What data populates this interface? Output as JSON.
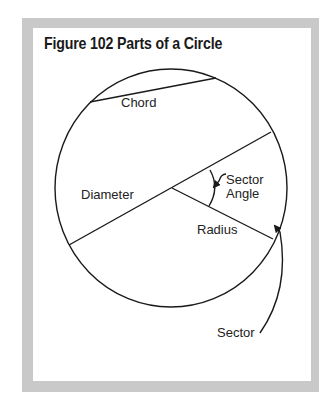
{
  "figure": {
    "title": "Figure 102  Parts of a Circle"
  },
  "labels": {
    "chord": "Chord",
    "diameter": "Diameter",
    "sector_angle_line1": "Sector",
    "sector_angle_line2": "Angle",
    "radius": "Radius",
    "sector": "Sector"
  },
  "colors": {
    "frame": "#c9c9c9",
    "panel": "#ffffff",
    "ink": "#1a1a1a"
  }
}
